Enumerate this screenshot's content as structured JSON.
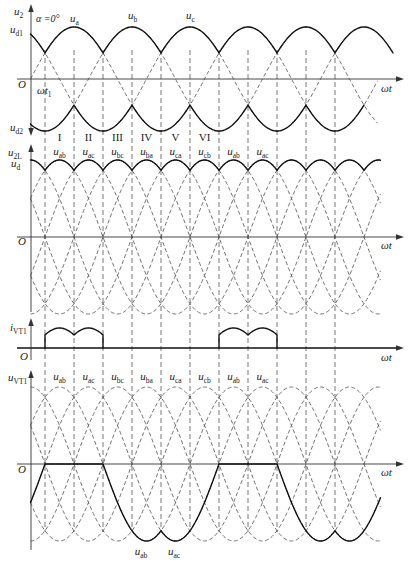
{
  "panel_phase": {
    "y_axis_label": {
      "main": "u",
      "sub": "2"
    },
    "alpha_label": "α =0°",
    "phase_labels": [
      {
        "main": "u",
        "sub": "a"
      },
      {
        "main": "u",
        "sub": "b"
      },
      {
        "main": "u",
        "sub": "c"
      }
    ],
    "ud1_label": {
      "main": "u",
      "sub": "d1"
    },
    "ud2_label": {
      "main": "u",
      "sub": "d2"
    },
    "origin_label": "O",
    "t1_label": {
      "main": "ωt",
      "sub": "1"
    },
    "x_axis_label": "ωt",
    "segment_labels": [
      "I",
      "II",
      "III",
      "IV",
      "V",
      "VI"
    ]
  },
  "panel_line": {
    "y_axis_labels": [
      {
        "main": "u",
        "sub": "2L"
      },
      {
        "main": "u",
        "sub": "d"
      }
    ],
    "interval_labels": [
      {
        "main": "u",
        "sub": "ab"
      },
      {
        "main": "u",
        "sub": "ac"
      },
      {
        "main": "u",
        "sub": "bc"
      },
      {
        "main": "u",
        "sub": "ba"
      },
      {
        "main": "u",
        "sub": "ca"
      },
      {
        "main": "u",
        "sub": "cb"
      },
      {
        "main": "u",
        "sub": "ab"
      },
      {
        "main": "u",
        "sub": "ac"
      }
    ],
    "origin_label": "O",
    "x_axis_label": "ωt"
  },
  "panel_current": {
    "y_axis_label": {
      "main": "i",
      "sub": "VT1"
    },
    "origin_label": "O",
    "x_axis_label": "ωt"
  },
  "panel_vt1": {
    "y_axis_label": {
      "main": "u",
      "sub": "VT1"
    },
    "interval_labels": [
      {
        "main": "u",
        "sub": "ab"
      },
      {
        "main": "u",
        "sub": "ac"
      },
      {
        "main": "u",
        "sub": "bc"
      },
      {
        "main": "u",
        "sub": "ba"
      },
      {
        "main": "u",
        "sub": "ca"
      },
      {
        "main": "u",
        "sub": "cb"
      },
      {
        "main": "u",
        "sub": "ab"
      },
      {
        "main": "u",
        "sub": "ac"
      }
    ],
    "trough_labels": [
      {
        "main": "u",
        "sub": "ab"
      },
      {
        "main": "u",
        "sub": "ac"
      }
    ],
    "origin_label": "O",
    "x_axis_label": "ωt"
  },
  "diagram_data": {
    "type": "waveform",
    "firing_angle_deg": 0,
    "phase_voltage_peaks_deg": {
      "a": 90,
      "b": 210,
      "c": 330
    },
    "line_voltage_peaks_deg": {
      "ab": 60,
      "ac": 120,
      "bc": 180,
      "ba": 240,
      "ca": 300,
      "cb": 0
    },
    "commutation_angles_deg": [
      30,
      90,
      150,
      210,
      270,
      330,
      390,
      450,
      510,
      570,
      630
    ],
    "vt1_conduction_intervals_deg": [
      [
        30,
        150
      ],
      [
        390,
        510
      ]
    ],
    "vt1_voltage_segments": [
      {
        "from_deg": 0,
        "to_deg": 30,
        "voltage": "ac"
      },
      {
        "from_deg": 30,
        "to_deg": 150,
        "voltage": "0"
      },
      {
        "from_deg": 150,
        "to_deg": 270,
        "voltage": "ab"
      },
      {
        "from_deg": 270,
        "to_deg": 390,
        "voltage": "ac"
      },
      {
        "from_deg": 390,
        "to_deg": 510,
        "voltage": "0"
      },
      {
        "from_deg": 510,
        "to_deg": 630,
        "voltage": "ab"
      },
      {
        "from_deg": 630,
        "to_deg": 724,
        "voltage": "ac"
      }
    ],
    "plot_range_deg": {
      "phase_dashed": [
        0,
        718
      ],
      "ud1_solid": [
        0,
        750
      ],
      "ud2_solid": [
        0,
        690
      ],
      "line": [
        0,
        724
      ],
      "vt1": [
        0,
        724
      ]
    }
  }
}
